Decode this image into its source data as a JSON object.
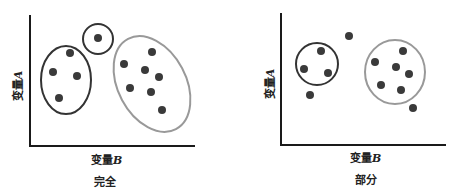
{
  "panels": [
    {
      "caption": "完全",
      "x_label": "变量",
      "x_var": "B",
      "y_label": "变量",
      "y_var": "A",
      "points": [
        [
          70,
          53
        ],
        [
          53,
          72
        ],
        [
          77,
          76
        ],
        [
          59,
          98
        ],
        [
          98,
          38
        ],
        [
          152,
          52
        ],
        [
          124,
          64
        ],
        [
          145,
          70
        ],
        [
          159,
          77
        ],
        [
          130,
          88
        ],
        [
          151,
          92
        ],
        [
          162,
          110
        ]
      ],
      "clusters": [
        {
          "cx": 66,
          "cy": 80,
          "rx": 25,
          "ry": 34,
          "rot": 0,
          "color": "#333333"
        },
        {
          "cx": 98,
          "cy": 39,
          "rx": 15,
          "ry": 15,
          "rot": 0,
          "color": "#333333"
        },
        {
          "cx": 152,
          "cy": 84,
          "rx": 34,
          "ry": 51,
          "rot": -28,
          "color": "#999999"
        }
      ]
    },
    {
      "caption": "部分",
      "x_label": "变量",
      "x_var": "B",
      "y_label": "变量",
      "y_var": "A",
      "points": [
        [
          321,
          51
        ],
        [
          304,
          69
        ],
        [
          328,
          73
        ],
        [
          310,
          95
        ],
        [
          349,
          36
        ],
        [
          403,
          51
        ],
        [
          375,
          62
        ],
        [
          396,
          67
        ],
        [
          409,
          74
        ],
        [
          381,
          85
        ],
        [
          401,
          90
        ],
        [
          413,
          108
        ]
      ],
      "clusters": [
        {
          "cx": 317,
          "cy": 64,
          "rx": 21,
          "ry": 21,
          "rot": 0,
          "color": "#333333"
        },
        {
          "cx": 395,
          "cy": 72,
          "rx": 30,
          "ry": 32,
          "rot": 0,
          "color": "#999999"
        }
      ]
    }
  ],
  "colors": {
    "axis": "#1a1a1a",
    "point": "#3a3a3a"
  }
}
